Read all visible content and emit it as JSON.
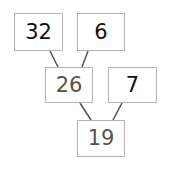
{
  "diagram": {
    "type": "number-tree",
    "colors": {
      "given_text": "#111111",
      "answer_text": "#555555",
      "box_border": "#b4b4b4",
      "connector": "#555555"
    },
    "nodes": {
      "top_left": {
        "value": "32",
        "role": "given"
      },
      "top_right": {
        "value": "6",
        "role": "given"
      },
      "middle_left": {
        "value": "26",
        "role": "answer"
      },
      "middle_right": {
        "value": "7",
        "role": "given"
      },
      "bottom": {
        "value": "19",
        "role": "answer"
      }
    },
    "edges": [
      {
        "from": "top_left",
        "to": "middle_left"
      },
      {
        "from": "top_right",
        "to": "middle_left"
      },
      {
        "from": "middle_left",
        "to": "bottom"
      },
      {
        "from": "middle_right",
        "to": "bottom"
      }
    ]
  }
}
